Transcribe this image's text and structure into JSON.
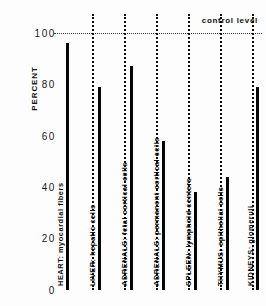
{
  "chart_data": {
    "type": "bar",
    "title": "",
    "subtitle": "",
    "xlabel": "",
    "ylabel": "PERCENT",
    "ylim": [
      0,
      100
    ],
    "yticks": [
      0,
      20,
      40,
      60,
      80,
      100
    ],
    "ytick_labels": [
      "0",
      "20",
      "40",
      "60",
      "80",
      "100"
    ],
    "grid": false,
    "legend": "none",
    "annotations": [
      {
        "name": "control-level",
        "label": "control  level",
        "value": 100,
        "style": "horizontal dotted reference line at 100 percent"
      }
    ],
    "categories": [
      "HEART: myocardial fibers",
      "LIVER: hepatic cells",
      "ADRENALS: fetal cortical cells",
      "ADRENALS: permanent cortical cells",
      "SPLEEN: lymphoid centers",
      "THYMUS: epithelial cells",
      "KIDNEYS: glomeruli"
    ],
    "values": [
      96,
      79,
      87,
      58,
      38,
      44,
      79
    ]
  },
  "axis": {
    "y_title": "PERCENT"
  },
  "colors": {
    "bar": "#050505",
    "divider": "#0a0a0a",
    "control_line": "#3a3a3a",
    "text": "#111111",
    "background": "#ffffff"
  }
}
